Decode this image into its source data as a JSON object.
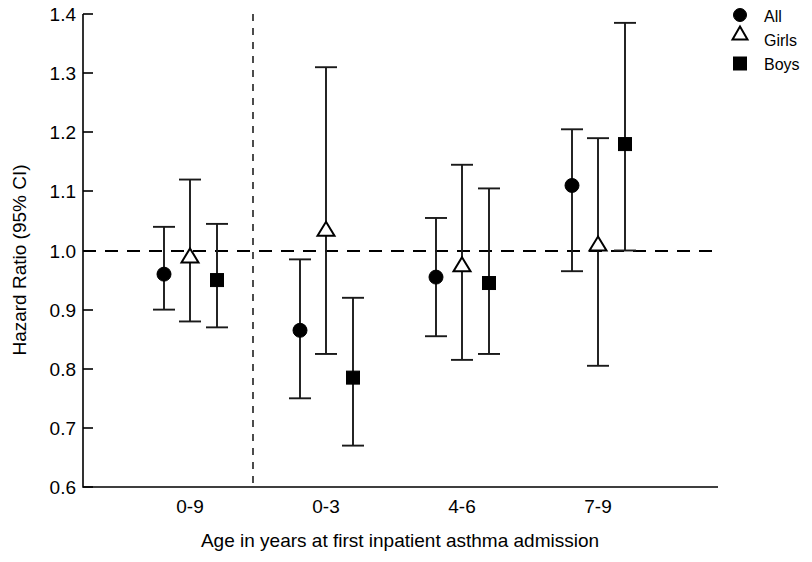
{
  "chart_data": {
    "type": "scatter",
    "title": "",
    "xlabel": "Age in years at first inpatient asthma admission",
    "ylabel": "Hazard Ratio (95% CI)",
    "ylim": [
      0.6,
      1.4
    ],
    "ytick_labels": [
      "1.4",
      "1.3",
      "1.2",
      "1.1",
      "1.0",
      "0.9",
      "0.8",
      "0.7",
      "0.6"
    ],
    "ytick_values": [
      1.4,
      1.3,
      1.2,
      1.1,
      1.0,
      0.9,
      0.8,
      0.7,
      0.6
    ],
    "categories": [
      "0-9",
      "0-3",
      "4-6",
      "7-9"
    ],
    "grid": false,
    "legend_position": "right-top",
    "reference_line": {
      "value": 1.0,
      "style": "dashed"
    },
    "separator_after_category": "0-9",
    "series": [
      {
        "name": "All",
        "marker": "filled-circle",
        "values": [
          0.96,
          0.865,
          0.955,
          1.11
        ],
        "ci_low": [
          0.9,
          0.75,
          0.855,
          0.965
        ],
        "ci_high": [
          1.04,
          0.985,
          1.055,
          1.205
        ]
      },
      {
        "name": "Girls",
        "marker": "open-triangle",
        "values": [
          0.99,
          1.035,
          0.975,
          1.01
        ],
        "ci_low": [
          0.88,
          0.825,
          0.815,
          0.805
        ],
        "ci_high": [
          1.12,
          1.31,
          1.145,
          1.19
        ]
      },
      {
        "name": "Boys",
        "marker": "filled-square",
        "values": [
          0.95,
          0.785,
          0.945,
          1.18
        ],
        "ci_low": [
          0.87,
          0.67,
          0.825,
          1.0
        ],
        "ci_high": [
          1.045,
          0.92,
          1.105,
          1.385
        ]
      }
    ]
  },
  "axes": {
    "y_title": "Hazard Ratio (95% CI)",
    "x_title": "Age in years at first inpatient asthma admission",
    "y_ticks": [
      "1.4",
      "1.3",
      "1.2",
      "1.1",
      "1.0",
      "0.9",
      "0.8",
      "0.7",
      "0.6"
    ],
    "x_ticks": [
      "0-9",
      "0-3",
      "4-6",
      "7-9"
    ]
  },
  "legend": {
    "items": [
      {
        "label": "All",
        "marker": "filled-circle"
      },
      {
        "label": "Girls",
        "marker": "open-triangle"
      },
      {
        "label": "Boys",
        "marker": "filled-square"
      }
    ]
  },
  "colors": {
    "foreground": "#000000",
    "background": "#ffffff"
  }
}
